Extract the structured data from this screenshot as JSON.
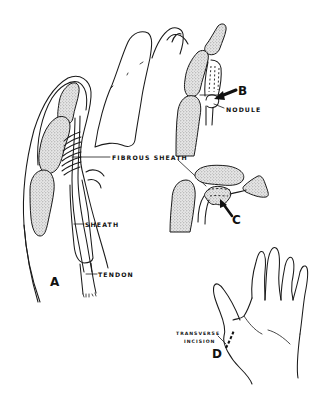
{
  "figure": {
    "panels": [
      {
        "id": "A",
        "label": "A",
        "description": "Lateral view of thumb with tendon and sheath"
      },
      {
        "id": "B",
        "label": "B",
        "description": "Nodule on flexor tendon proximal to sheath"
      },
      {
        "id": "C",
        "label": "C",
        "description": "Nodule caught within sheath in flexed position"
      },
      {
        "id": "D",
        "label": "D",
        "description": "Palm view showing transverse incision site"
      }
    ],
    "labels": {
      "fibrous_sheath": "FIBROUS SHEATH",
      "sheath": "SHEATH",
      "tendon": "TENDON",
      "nodule": "NODULE",
      "transverse": "TRANSVERSE",
      "incision": "INCISION"
    },
    "colors": {
      "ink": "#1a1a1a",
      "bone_fill": "#cfcfcf",
      "background": "#ffffff"
    }
  }
}
